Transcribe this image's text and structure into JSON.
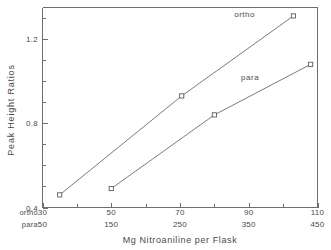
{
  "chart_data": {
    "type": "line",
    "title": "",
    "subtitle": "",
    "xlabel": "Mg Nitroaniline per Flask",
    "ylabel": "Peak Height Ratios",
    "grid": false,
    "legend_position": "inline-annotation",
    "ylim": [
      0.4,
      1.35
    ],
    "y_major_ticks": [
      0.4,
      0.8,
      1.2
    ],
    "y_major_tick_labels": [
      "0.4",
      "0.8",
      "1.2"
    ],
    "y_minor_ticks": [
      0.5,
      0.6,
      0.7,
      0.9,
      1.0,
      1.1,
      1.3
    ],
    "x_axes": [
      {
        "key": "ortho",
        "name": "ortho",
        "ticks": [
          30,
          50,
          70,
          90,
          110
        ],
        "tick_labels": [
          "30",
          "50",
          "70",
          "90",
          "110"
        ],
        "xlim": [
          30,
          110
        ]
      },
      {
        "key": "para",
        "name": "para",
        "ticks": [
          50,
          150,
          250,
          350,
          450
        ],
        "tick_labels": [
          "50",
          "150",
          "250",
          "350",
          "450"
        ],
        "xlim": [
          50,
          450
        ]
      }
    ],
    "series": [
      {
        "name": "ortho",
        "axis": "ortho",
        "label": "ortho",
        "marker": "open-square",
        "x": [
          35,
          70.5,
          103
        ],
        "y": [
          0.46,
          0.93,
          1.31
        ]
      },
      {
        "name": "para",
        "axis": "para",
        "label": "para",
        "marker": "open-square",
        "x": [
          150,
          300,
          440
        ],
        "y": [
          0.49,
          0.84,
          1.08
        ]
      }
    ],
    "annotations": [
      {
        "text": "ortho",
        "x_frac": 0.735,
        "y_value": 1.305
      },
      {
        "text": "para",
        "x_frac": 0.755,
        "y_value": 1.005
      }
    ],
    "colors": {
      "axis": "#6e6e6e",
      "line": "#6b6b6b",
      "marker_stroke": "#5d5d5d",
      "marker_fill": "#ffffff",
      "text": "#4a4a4a",
      "background": "#ffffff"
    }
  },
  "axis_row_keys": {
    "ortho": "ortho",
    "para": "para"
  }
}
